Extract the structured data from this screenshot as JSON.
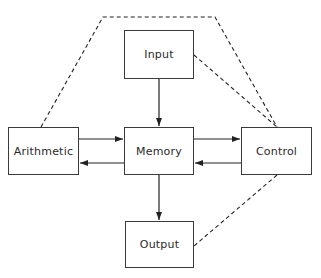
{
  "diagram": {
    "type": "block-diagram",
    "nodes": [
      {
        "id": "input",
        "label": "Input",
        "x": 124,
        "y": 30,
        "w": 70,
        "h": 49
      },
      {
        "id": "arithmetic",
        "label": "Arithmetic",
        "x": 8,
        "y": 127,
        "w": 71,
        "h": 48
      },
      {
        "id": "memory",
        "label": "Memory",
        "x": 124,
        "y": 127,
        "w": 70,
        "h": 48
      },
      {
        "id": "control",
        "label": "Control",
        "x": 241,
        "y": 127,
        "w": 71,
        "h": 48
      },
      {
        "id": "output",
        "label": "Output",
        "x": 125,
        "y": 221,
        "w": 69,
        "h": 47
      }
    ],
    "edges": [
      {
        "from": "input",
        "to": "memory",
        "style": "solid-arrow"
      },
      {
        "from": "arithmetic",
        "to": "memory",
        "style": "solid-arrow"
      },
      {
        "from": "memory",
        "to": "arithmetic",
        "style": "solid-arrow"
      },
      {
        "from": "memory",
        "to": "control",
        "style": "solid-arrow"
      },
      {
        "from": "control",
        "to": "memory",
        "style": "solid-arrow"
      },
      {
        "from": "memory",
        "to": "output",
        "style": "solid-arrow"
      },
      {
        "from": "control",
        "to": "arithmetic",
        "style": "dashed",
        "route": "over-top"
      },
      {
        "from": "control",
        "to": "input",
        "style": "dashed"
      },
      {
        "from": "control",
        "to": "output",
        "style": "dashed"
      }
    ],
    "colors": {
      "line": "#222222",
      "box_border": "#3a3a3a",
      "text": "#2a2a2a",
      "background": "#ffffff"
    }
  }
}
